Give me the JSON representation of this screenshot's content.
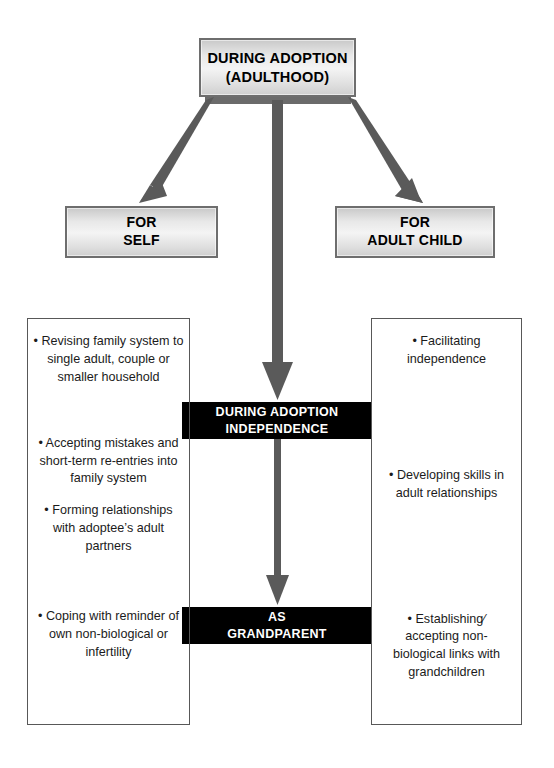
{
  "diagram": {
    "title": "During Adoption (Adulthood)",
    "type": "flow-diagram"
  },
  "header": {
    "line1": "DURING ADOPTION",
    "line2": "(ADULTHOOD)"
  },
  "branches": {
    "left": {
      "line1": "FOR",
      "line2": "SELF"
    },
    "right": {
      "line1": "FOR",
      "line2": "ADULT CHILD"
    }
  },
  "stages": [
    {
      "id": "independence",
      "line1": "DURING ADOPTION",
      "line2": "INDEPENDENCE"
    },
    {
      "id": "grandparent",
      "line1": "AS",
      "line2": "GRANDPARENT"
    }
  ],
  "columns": {
    "left": {
      "label": "for-self-tasks",
      "items": [
        "• Revising family system to single adult, couple or smaller household",
        "• Accepting mistakes and short-term re-entries into family system",
        "• Forming relationships with adoptee’s adult partners",
        "• Coping with reminder of own non-biological or infertility"
      ]
    },
    "right": {
      "label": "for-adult-child-tasks",
      "items": [
        "• Facilitating independence",
        "• Developing skills in adult relationships",
        "• Establishing⁄ accepting non-biological links with grandchildren"
      ]
    }
  },
  "colors": {
    "box_border": "#6e6e6e",
    "box_fill_light": "#f4f4f4",
    "box_fill_dark": "#c9c9c9",
    "banner_fill": "#000000",
    "banner_text": "#ffffff",
    "arrow": "#5a5a5a",
    "column_border": "#585858",
    "body_text": "#1b1b1b",
    "background": "#ffffff"
  }
}
